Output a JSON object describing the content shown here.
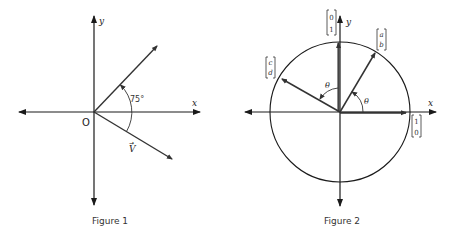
{
  "figure1": {
    "caption": "Figure 1",
    "axis_x_label": "x",
    "axis_y_label": "y",
    "origin_label": "O",
    "angle_label": "75°",
    "vector_label": "V",
    "vector_arrow_mark": "→"
  },
  "figure2": {
    "caption": "Figure 2",
    "axis_x_label": "x",
    "axis_y_label": "y",
    "angle_label_1": "θ",
    "angle_label_2": "θ",
    "vec_e2": {
      "top": "0",
      "bottom": "1"
    },
    "vec_ab": {
      "top": "a",
      "bottom": "b"
    },
    "vec_cd": {
      "top": "c",
      "bottom": "d"
    },
    "vec_e1": {
      "top": "1",
      "bottom": "0"
    }
  },
  "colors": {
    "ink": "#1a1a1a",
    "vector": "#333333",
    "background": "#ffffff"
  }
}
